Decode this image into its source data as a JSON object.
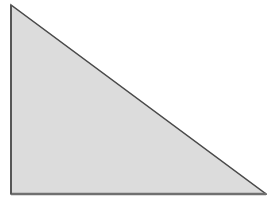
{
  "diagram": {
    "shape": "right-triangle",
    "vertices": [
      [
        11,
        5
      ],
      [
        11,
        194
      ],
      [
        266,
        194
      ]
    ],
    "fill": "#dcdcdc",
    "stroke": "#4a4a4a",
    "stroke_width": 1.5,
    "background": "#ffffff"
  }
}
